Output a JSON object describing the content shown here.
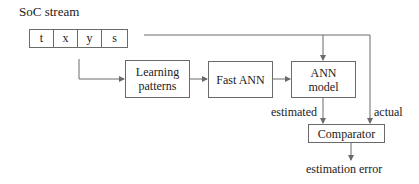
{
  "title": "SoC stream",
  "stream_fields": [
    "t",
    "x",
    "y",
    "s"
  ],
  "blocks": {
    "learning": "Learning\npatterns",
    "learning_line1": "Learning",
    "learning_line2": "patterns",
    "fast_ann": "Fast ANN",
    "ann_model_line1": "ANN",
    "ann_model_line2": "model",
    "comparator": "Comparator"
  },
  "edge_labels": {
    "estimated": "estimated",
    "actual": "actual"
  },
  "output": "estimation error",
  "colors": {
    "line": "#6a6a6a",
    "text": "#222222"
  }
}
